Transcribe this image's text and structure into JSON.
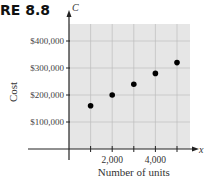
{
  "figure_label": "RE 8.8",
  "chart_data": {
    "type": "scatter",
    "title": "",
    "xlabel": "Number of units",
    "ylabel": "Cost",
    "x_axis_var": "x",
    "y_axis_var": "C",
    "x": [
      1000,
      2000,
      3000,
      4000,
      5000
    ],
    "y": [
      160000,
      200000,
      240000,
      280000,
      320000
    ],
    "xticks": [
      1000,
      2000,
      3000,
      4000,
      5000
    ],
    "xtick_labels": [
      "",
      "2,000",
      "",
      "4,000",
      ""
    ],
    "yticks": [
      100000,
      200000,
      300000,
      400000
    ],
    "ytick_labels": [
      "$100,000",
      "$200,000",
      "$300,000",
      "$400,000"
    ],
    "xlim": [
      0,
      5700
    ],
    "ylim": [
      -40000,
      460000
    ],
    "grid": true,
    "legend": null
  }
}
